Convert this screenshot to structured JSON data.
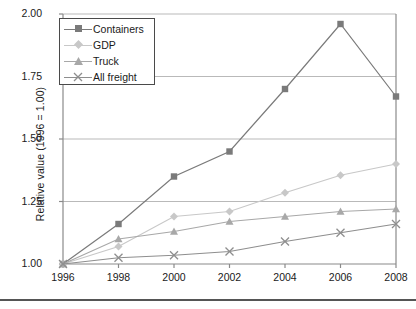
{
  "chart_data": {
    "type": "line",
    "title": "",
    "subtitle": "",
    "xlabel": "",
    "ylabel": "Relative value (1996 = 1.00)",
    "x": [
      1996,
      1998,
      2000,
      2002,
      2004,
      2006,
      2008
    ],
    "xtick_labels": [
      "1996",
      "1998",
      "2000",
      "2002",
      "2004",
      "2006",
      "2008"
    ],
    "ytick_labels": [
      "1.00",
      "1.25",
      "1.50",
      "1.75",
      "2.00"
    ],
    "yticks": [
      1.0,
      1.25,
      1.5,
      1.75,
      2.0
    ],
    "ylim": [
      1.0,
      2.0
    ],
    "xlim": [
      1996,
      2008
    ],
    "grid": "horizontal",
    "legend_position": "top-left",
    "series": [
      {
        "name": "Containers",
        "marker": "square",
        "color": "#7a7a7a",
        "values": [
          1.0,
          1.16,
          1.35,
          1.45,
          1.7,
          1.96,
          1.67
        ]
      },
      {
        "name": "GDP",
        "marker": "diamond",
        "color": "#c8c8c8",
        "values": [
          1.0,
          1.07,
          1.19,
          1.21,
          1.285,
          1.355,
          1.4
        ]
      },
      {
        "name": "Truck",
        "marker": "triangle",
        "color": "#a8a8a8",
        "values": [
          1.0,
          1.1,
          1.13,
          1.17,
          1.19,
          1.21,
          1.22
        ]
      },
      {
        "name": "All freight",
        "marker": "cross",
        "color": "#8e8e8e",
        "values": [
          1.0,
          1.025,
          1.035,
          1.05,
          1.09,
          1.125,
          1.16
        ]
      }
    ]
  },
  "legend": {
    "items": [
      {
        "label": "Containers"
      },
      {
        "label": "GDP"
      },
      {
        "label": "Truck"
      },
      {
        "label": "All freight"
      }
    ]
  }
}
